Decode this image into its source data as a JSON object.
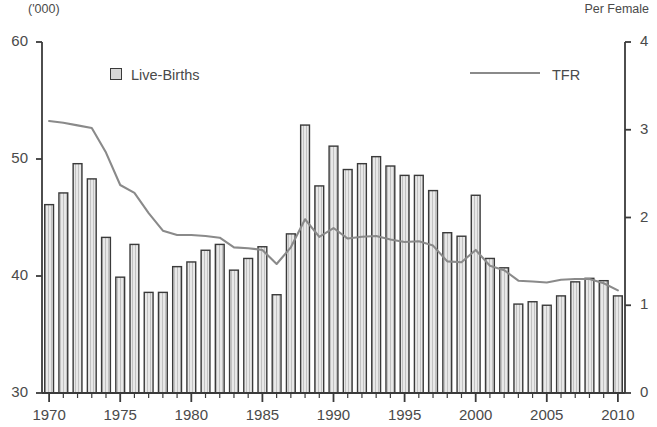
{
  "chart_data": {
    "type": "bar",
    "title": "",
    "subtitle": "",
    "xlabel": "",
    "ylabel": "('000)",
    "ylabel_right": "Per Female",
    "grid": false,
    "legend_position": "top",
    "ylim": [
      30,
      60
    ],
    "yticks": [
      "30",
      "40",
      "50",
      "60"
    ],
    "ylim_right": [
      0,
      4
    ],
    "yticks_right": [
      "0",
      "1",
      "2",
      "3",
      "4"
    ],
    "xlim": [
      1970,
      2010
    ],
    "xticks": [
      "1970",
      "1975",
      "1980",
      "1985",
      "1990",
      "1995",
      "2000",
      "2005",
      "2010"
    ],
    "categories": [
      "1970",
      "1971",
      "1972",
      "1973",
      "1974",
      "1975",
      "1976",
      "1977",
      "1978",
      "1979",
      "1980",
      "1981",
      "1982",
      "1983",
      "1984",
      "1985",
      "1986",
      "1987",
      "1988",
      "1989",
      "1990",
      "1991",
      "1992",
      "1993",
      "1994",
      "1995",
      "1996",
      "1997",
      "1998",
      "1999",
      "2000",
      "2001",
      "2002",
      "2003",
      "2004",
      "2005",
      "2006",
      "2007",
      "2008",
      "2009",
      "2010"
    ],
    "series": [
      {
        "name": "Live-Births",
        "type": "bar",
        "axis": "left",
        "unit": "'000",
        "values": [
          46.1,
          47.1,
          49.6,
          48.3,
          43.3,
          39.9,
          42.7,
          38.6,
          38.6,
          40.8,
          41.2,
          42.2,
          42.7,
          40.5,
          41.5,
          42.5,
          38.4,
          43.6,
          52.9,
          47.7,
          51.1,
          49.1,
          49.6,
          50.2,
          49.4,
          48.6,
          48.6,
          47.3,
          43.7,
          43.4,
          46.9,
          41.5,
          40.7,
          37.6,
          37.8,
          37.5,
          38.3,
          39.5,
          39.8,
          39.6,
          38.3
        ]
      },
      {
        "name": "TFR",
        "type": "line",
        "axis": "right",
        "unit": "per female",
        "values": [
          3.1,
          3.08,
          3.05,
          3.02,
          2.74,
          2.37,
          2.28,
          2.05,
          1.85,
          1.8,
          1.8,
          1.79,
          1.77,
          1.66,
          1.65,
          1.63,
          1.47,
          1.66,
          1.98,
          1.78,
          1.88,
          1.76,
          1.78,
          1.79,
          1.75,
          1.72,
          1.73,
          1.68,
          1.5,
          1.49,
          1.63,
          1.45,
          1.4,
          1.28,
          1.27,
          1.26,
          1.29,
          1.3,
          1.3,
          1.25,
          1.17
        ]
      }
    ]
  },
  "legend": {
    "births_label": "Live-Births",
    "tfr_label": "TFR"
  },
  "axis_units": {
    "left": "('000)",
    "right": "Per Female"
  },
  "colors": {
    "bar_fill": "#dcdcdc",
    "bar_stroke": "#3a3a3a",
    "line": "#8a8a8a",
    "axis": "#3a3a3a",
    "text": "#4a4a4a"
  }
}
